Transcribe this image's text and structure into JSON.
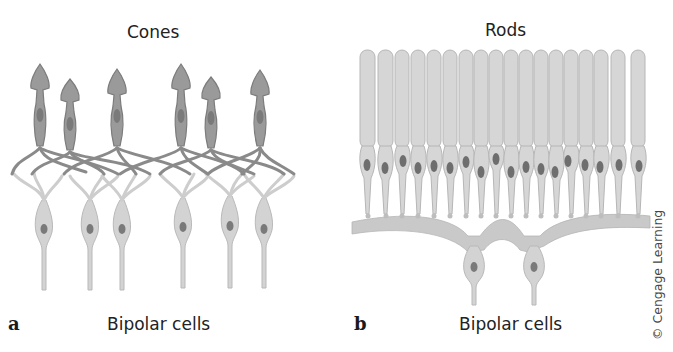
{
  "figure": {
    "panel_a": {
      "letter": "a",
      "title": "Cones",
      "bottom_label": "Bipolar cells",
      "cone_count": 6,
      "bipolar_count": 6
    },
    "panel_b": {
      "letter": "b",
      "title": "Rods",
      "bottom_label": "Bipolar cells",
      "rod_count": 18,
      "bipolar_count": 2
    },
    "credit": "© Cengage Learning",
    "colors": {
      "cone_fill": "#9a9a9a",
      "cone_stroke": "#7a7a7a",
      "nucleus": "#6e6e6e",
      "rod_fill": "#d6d6d6",
      "rod_stroke": "#b8b8b8",
      "bipolar_fill": "#cfcfcf",
      "background": "#ffffff"
    }
  }
}
